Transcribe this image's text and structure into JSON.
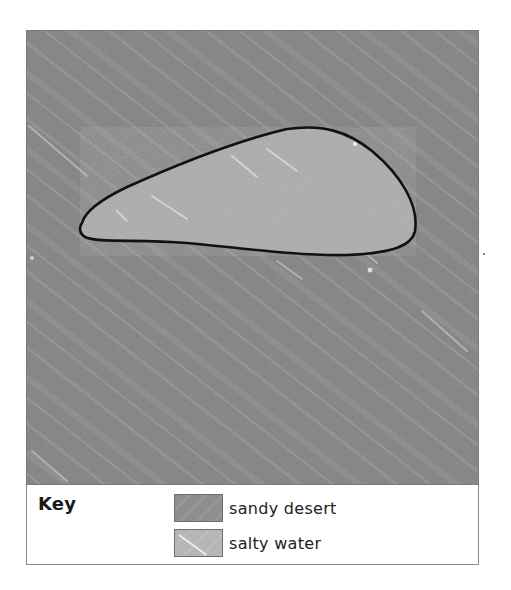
{
  "map": {
    "colors": {
      "sandy_desert": "#8d8d8d",
      "salty_water": "#b5b5b5",
      "outline": "#111111"
    },
    "features": [
      {
        "name": "salty-water-lake",
        "type": "salty water",
        "outline": "black"
      }
    ]
  },
  "key": {
    "title": "Key",
    "items": [
      {
        "label": "sandy desert",
        "swatch_color": "#8f8f8f"
      },
      {
        "label": "salty water",
        "swatch_color": "#b6b6b6"
      }
    ]
  }
}
